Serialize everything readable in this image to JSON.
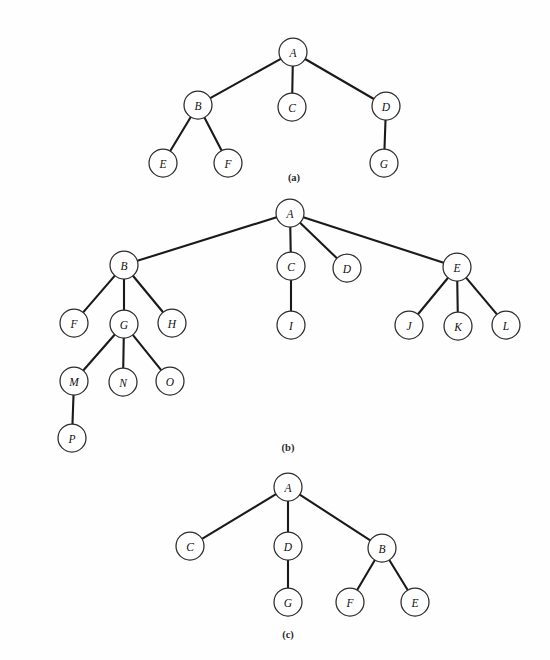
{
  "figure": {
    "background_color": "#fefefe",
    "node_stroke_color": "#2b2b2b",
    "edge_color": "#1a1a1a",
    "node_fill_color": "#ffffff",
    "node_radius": 14,
    "label_color": "#111111"
  },
  "panels": [
    {
      "id": "panel-a",
      "caption": "(a)",
      "caption_pos": {
        "x": 294,
        "y": 177
      },
      "nodes": [
        {
          "id": "a-A",
          "label": "A",
          "x": 293,
          "y": 52
        },
        {
          "id": "a-B",
          "label": "B",
          "x": 198,
          "y": 105
        },
        {
          "id": "a-C",
          "label": "C",
          "x": 292,
          "y": 107
        },
        {
          "id": "a-D",
          "label": "D",
          "x": 386,
          "y": 106
        },
        {
          "id": "a-E",
          "label": "E",
          "x": 163,
          "y": 163
        },
        {
          "id": "a-F",
          "label": "F",
          "x": 228,
          "y": 163
        },
        {
          "id": "a-G",
          "label": "G",
          "x": 384,
          "y": 163
        }
      ],
      "edges": [
        {
          "from": "a-A",
          "to": "a-B"
        },
        {
          "from": "a-A",
          "to": "a-C"
        },
        {
          "from": "a-A",
          "to": "a-D"
        },
        {
          "from": "a-B",
          "to": "a-E"
        },
        {
          "from": "a-B",
          "to": "a-F"
        },
        {
          "from": "a-D",
          "to": "a-G"
        }
      ]
    },
    {
      "id": "panel-b",
      "caption": "(b)",
      "caption_pos": {
        "x": 288,
        "y": 447
      },
      "nodes": [
        {
          "id": "b-A",
          "label": "A",
          "x": 290,
          "y": 213
        },
        {
          "id": "b-B",
          "label": "B",
          "x": 124,
          "y": 265
        },
        {
          "id": "b-C",
          "label": "C",
          "x": 291,
          "y": 266
        },
        {
          "id": "b-D",
          "label": "D",
          "x": 347,
          "y": 268
        },
        {
          "id": "b-E",
          "label": "E",
          "x": 457,
          "y": 267
        },
        {
          "id": "b-F",
          "label": "F",
          "x": 74,
          "y": 323
        },
        {
          "id": "b-G",
          "label": "G",
          "x": 124,
          "y": 324
        },
        {
          "id": "b-H",
          "label": "H",
          "x": 172,
          "y": 323
        },
        {
          "id": "b-I",
          "label": "I",
          "x": 291,
          "y": 325
        },
        {
          "id": "b-J",
          "label": "J",
          "x": 409,
          "y": 325
        },
        {
          "id": "b-K",
          "label": "K",
          "x": 458,
          "y": 326
        },
        {
          "id": "b-L",
          "label": "L",
          "x": 506,
          "y": 325
        },
        {
          "id": "b-M",
          "label": "M",
          "x": 74,
          "y": 381
        },
        {
          "id": "b-N",
          "label": "N",
          "x": 123,
          "y": 382
        },
        {
          "id": "b-O",
          "label": "O",
          "x": 170,
          "y": 381
        },
        {
          "id": "b-P",
          "label": "P",
          "x": 72,
          "y": 438
        }
      ],
      "edges": [
        {
          "from": "b-A",
          "to": "b-B"
        },
        {
          "from": "b-A",
          "to": "b-C"
        },
        {
          "from": "b-A",
          "to": "b-D"
        },
        {
          "from": "b-A",
          "to": "b-E"
        },
        {
          "from": "b-B",
          "to": "b-F"
        },
        {
          "from": "b-B",
          "to": "b-G"
        },
        {
          "from": "b-B",
          "to": "b-H"
        },
        {
          "from": "b-C",
          "to": "b-I"
        },
        {
          "from": "b-E",
          "to": "b-J"
        },
        {
          "from": "b-E",
          "to": "b-K"
        },
        {
          "from": "b-E",
          "to": "b-L"
        },
        {
          "from": "b-G",
          "to": "b-M"
        },
        {
          "from": "b-G",
          "to": "b-N"
        },
        {
          "from": "b-G",
          "to": "b-O"
        },
        {
          "from": "b-M",
          "to": "b-P"
        }
      ]
    },
    {
      "id": "panel-c",
      "caption": "(c)",
      "caption_pos": {
        "x": 288,
        "y": 634
      },
      "nodes": [
        {
          "id": "c-A",
          "label": "A",
          "x": 288,
          "y": 487
        },
        {
          "id": "c-C",
          "label": "C",
          "x": 190,
          "y": 546
        },
        {
          "id": "c-D",
          "label": "D",
          "x": 288,
          "y": 546
        },
        {
          "id": "c-B",
          "label": "B",
          "x": 382,
          "y": 548
        },
        {
          "id": "c-G",
          "label": "G",
          "x": 288,
          "y": 602
        },
        {
          "id": "c-F",
          "label": "F",
          "x": 350,
          "y": 602
        },
        {
          "id": "c-E",
          "label": "E",
          "x": 415,
          "y": 602
        }
      ],
      "edges": [
        {
          "from": "c-A",
          "to": "c-C"
        },
        {
          "from": "c-A",
          "to": "c-D"
        },
        {
          "from": "c-A",
          "to": "c-B"
        },
        {
          "from": "c-D",
          "to": "c-G"
        },
        {
          "from": "c-B",
          "to": "c-F"
        },
        {
          "from": "c-B",
          "to": "c-E"
        }
      ]
    }
  ]
}
